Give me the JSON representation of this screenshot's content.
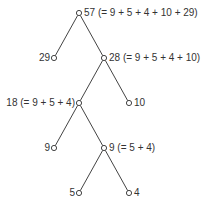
{
  "diagram": {
    "type": "tree",
    "line_color": "#444444",
    "nodes": [
      {
        "id": "n57",
        "label": "57 (= 9 + 5 + 4 + 10 + 29)",
        "x": 79,
        "y": 13,
        "side": "right"
      },
      {
        "id": "n29",
        "label": "29",
        "x": 54,
        "y": 58,
        "side": "left"
      },
      {
        "id": "n28",
        "label": "28 (= 9 + 5 + 4 + 10)",
        "x": 104,
        "y": 58,
        "side": "right"
      },
      {
        "id": "n18",
        "label": "18 (= 9 + 5 + 4)",
        "x": 79,
        "y": 103,
        "side": "left"
      },
      {
        "id": "n10",
        "label": "10",
        "x": 129,
        "y": 103,
        "side": "right"
      },
      {
        "id": "n9a",
        "label": "9",
        "x": 54,
        "y": 148,
        "side": "left"
      },
      {
        "id": "n9b",
        "label": "9 (= 5 + 4)",
        "x": 104,
        "y": 148,
        "side": "right"
      },
      {
        "id": "n5",
        "label": "5",
        "x": 79,
        "y": 193,
        "side": "left"
      },
      {
        "id": "n4",
        "label": "4",
        "x": 129,
        "y": 193,
        "side": "right"
      }
    ],
    "edges": [
      [
        "n57",
        "n29"
      ],
      [
        "n57",
        "n28"
      ],
      [
        "n28",
        "n18"
      ],
      [
        "n28",
        "n10"
      ],
      [
        "n18",
        "n9a"
      ],
      [
        "n18",
        "n9b"
      ],
      [
        "n9b",
        "n5"
      ],
      [
        "n9b",
        "n4"
      ]
    ]
  }
}
